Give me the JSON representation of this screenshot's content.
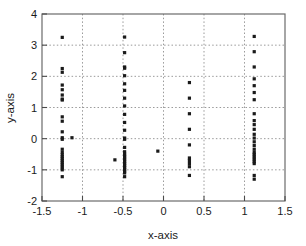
{
  "chart_data": {
    "type": "scatter",
    "title": "",
    "xlabel": "x-axis",
    "ylabel": "y-axis",
    "xlim": [
      -1.5,
      1.5
    ],
    "ylim": [
      -2,
      4
    ],
    "xticks": [
      -1.5,
      -1,
      -0.5,
      0,
      0.5,
      1,
      1.5
    ],
    "xticklabels": [
      "-1.5",
      "-1",
      "-0.5",
      "0",
      "0.5",
      "1",
      "1.5"
    ],
    "yticks": [
      -2,
      -1,
      0,
      1,
      2,
      3,
      4
    ],
    "yticklabels": [
      "-2",
      "-1",
      "0",
      "1",
      "2",
      "3",
      "4"
    ],
    "grid": true,
    "grid_style": "dotted",
    "grid_color": "#9a9a9a",
    "marker": "square",
    "marker_color": "#1a1a1a",
    "marker_size": 3.2,
    "legend": null,
    "points": [
      [
        -1.25,
        3.25
      ],
      [
        -1.25,
        2.25
      ],
      [
        -1.25,
        2.13
      ],
      [
        -1.25,
        1.72
      ],
      [
        -1.25,
        1.57
      ],
      [
        -1.25,
        1.4
      ],
      [
        -1.25,
        1.27
      ],
      [
        -1.25,
        1.24
      ],
      [
        -1.25,
        0.7
      ],
      [
        -1.25,
        0.56
      ],
      [
        -1.25,
        0.22
      ],
      [
        -1.25,
        0.03
      ],
      [
        -1.25,
        -0.02
      ],
      [
        -1.25,
        -0.34
      ],
      [
        -1.25,
        -0.44
      ],
      [
        -1.25,
        -0.52
      ],
      [
        -1.25,
        -0.58
      ],
      [
        -1.25,
        -0.64
      ],
      [
        -1.25,
        -0.7
      ],
      [
        -1.25,
        -0.76
      ],
      [
        -1.25,
        -0.82
      ],
      [
        -1.25,
        -0.88
      ],
      [
        -1.25,
        -0.94
      ],
      [
        -1.25,
        -1.0
      ],
      [
        -1.25,
        -1.22
      ],
      [
        -1.13,
        0.03
      ],
      [
        -0.6,
        -0.68
      ],
      [
        -0.48,
        3.26
      ],
      [
        -0.48,
        2.76
      ],
      [
        -0.48,
        2.3
      ],
      [
        -0.48,
        2.26
      ],
      [
        -0.48,
        2.02
      ],
      [
        -0.48,
        1.76
      ],
      [
        -0.48,
        1.55
      ],
      [
        -0.48,
        1.3
      ],
      [
        -0.48,
        1.05
      ],
      [
        -0.48,
        0.78
      ],
      [
        -0.48,
        0.52
      ],
      [
        -0.48,
        0.27
      ],
      [
        -0.48,
        0.02
      ],
      [
        -0.48,
        -0.02
      ],
      [
        -0.48,
        -0.28
      ],
      [
        -0.48,
        -0.42
      ],
      [
        -0.48,
        -0.5
      ],
      [
        -0.48,
        -0.56
      ],
      [
        -0.48,
        -0.62
      ],
      [
        -0.48,
        -0.68
      ],
      [
        -0.48,
        -0.74
      ],
      [
        -0.48,
        -0.8
      ],
      [
        -0.48,
        -0.86
      ],
      [
        -0.48,
        -0.92
      ],
      [
        -0.48,
        -0.98
      ],
      [
        -0.48,
        -1.04
      ],
      [
        -0.48,
        -1.1
      ],
      [
        -0.48,
        -1.22
      ],
      [
        -0.07,
        -0.4
      ],
      [
        0.32,
        1.8
      ],
      [
        0.32,
        1.3
      ],
      [
        0.32,
        0.8
      ],
      [
        0.32,
        0.3
      ],
      [
        0.32,
        -0.2
      ],
      [
        0.32,
        -0.62
      ],
      [
        0.32,
        -0.7
      ],
      [
        0.32,
        -0.8
      ],
      [
        0.32,
        -0.9
      ],
      [
        0.32,
        -1.18
      ],
      [
        1.12,
        3.28
      ],
      [
        1.12,
        2.79
      ],
      [
        1.12,
        2.3
      ],
      [
        1.12,
        1.92
      ],
      [
        1.12,
        1.7
      ],
      [
        1.12,
        1.48
      ],
      [
        1.12,
        1.25
      ],
      [
        1.12,
        0.8
      ],
      [
        1.12,
        0.58
      ],
      [
        1.12,
        0.45
      ],
      [
        1.12,
        0.3
      ],
      [
        1.12,
        0.14
      ],
      [
        1.12,
        0.02
      ],
      [
        1.12,
        -0.1
      ],
      [
        1.12,
        -0.22
      ],
      [
        1.12,
        -0.34
      ],
      [
        1.12,
        -0.44
      ],
      [
        1.12,
        -0.5
      ],
      [
        1.12,
        -0.56
      ],
      [
        1.12,
        -0.62
      ],
      [
        1.12,
        -0.68
      ],
      [
        1.12,
        -0.74
      ],
      [
        1.12,
        -0.8
      ],
      [
        1.12,
        -1.18
      ],
      [
        1.12,
        -1.3
      ]
    ]
  },
  "axes": {
    "frame_color": "#6b6b6b",
    "background": "#ffffff"
  }
}
